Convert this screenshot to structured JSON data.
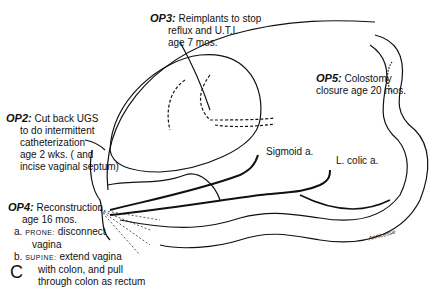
{
  "figure": {
    "panel_label": "C",
    "signature": "Annicesse"
  },
  "annotations": {
    "op3": {
      "tag": "OP3:",
      "lines": [
        "Reimplants to stop",
        "reflux and U.T.I.",
        "age 7 mos."
      ]
    },
    "op2": {
      "tag": "OP2:",
      "lines": [
        "Cut back UGS",
        "to do intermittent",
        "catheterization",
        "age 2 wks. ( and",
        "incise vaginal septum)"
      ]
    },
    "op5": {
      "tag": "OP5:",
      "lines": [
        "Colostomy",
        "closure age 20 mos."
      ]
    },
    "op4": {
      "tag": "OP4:",
      "lines": [
        "Reconstruction",
        "age 16 mos."
      ],
      "step_a": {
        "marker": "a.",
        "position": "PRONE:",
        "text": "disconnect",
        "text2": "vagina"
      },
      "step_b": {
        "marker": "b.",
        "position": "SUPINE:",
        "text": "extend vagina",
        "text2": "with colon, and pull",
        "text3": "through colon as rectum"
      }
    },
    "vessels": {
      "sigmoid": "Sigmoid a.",
      "left_colic": "L. colic a."
    }
  }
}
